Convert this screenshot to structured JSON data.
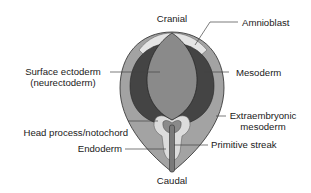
{
  "diagram": {
    "labels": {
      "cranial": "Cranial",
      "caudal": "Caudal",
      "amnioblast": "Amnioblast",
      "surface_ectoderm_line1": "Surface ectoderm",
      "surface_ectoderm_line2": "(neurectoderm)",
      "mesoderm": "Mesoderm",
      "extraembryonic_line1": "Extraembryonic",
      "extraembryonic_line2": "mesoderm",
      "head_process": "Head process/notochord",
      "endoderm": "Endoderm",
      "primitive_streak": "Primitive streak"
    },
    "colors": {
      "outer_extraembryonic": "#a3a3a3",
      "amnioblast": "#e4e4e4",
      "mesoderm": "#444444",
      "surface_ectoderm": "#8a8a8a",
      "endoderm": "#dcdcdc",
      "outline": "#2a2a2a",
      "leader_line": "#444444"
    }
  }
}
